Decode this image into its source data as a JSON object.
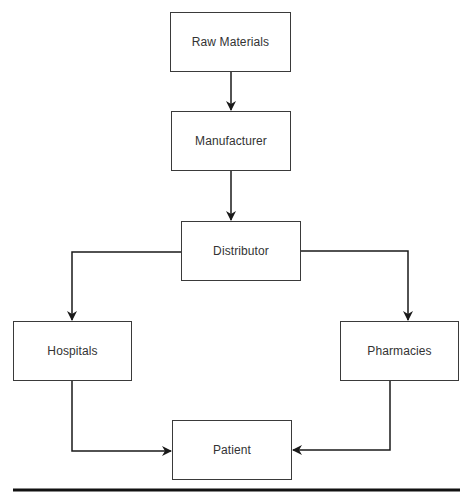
{
  "diagram": {
    "type": "flowchart",
    "title": "",
    "colors": {
      "line": "#1a1a1a",
      "border": "#3a3a3a",
      "text": "#333333",
      "background": "#ffffff"
    },
    "nodes": [
      {
        "id": "raw_materials",
        "label": "Raw Materials",
        "x": 170,
        "y": 12,
        "w": 121,
        "h": 60
      },
      {
        "id": "manufacturer",
        "label": "Manufacturer",
        "x": 171,
        "y": 111,
        "w": 120,
        "h": 60
      },
      {
        "id": "distributor",
        "label": "Distributor",
        "x": 181,
        "y": 221,
        "w": 120,
        "h": 60
      },
      {
        "id": "hospitals",
        "label": "Hospitals",
        "x": 13,
        "y": 321,
        "w": 119,
        "h": 60
      },
      {
        "id": "pharmacies",
        "label": "Pharmacies",
        "x": 340,
        "y": 321,
        "w": 119,
        "h": 60
      },
      {
        "id": "patient",
        "label": "Patient",
        "x": 172,
        "y": 420,
        "w": 120,
        "h": 60
      }
    ],
    "edges": [
      {
        "from": "raw_materials",
        "to": "manufacturer"
      },
      {
        "from": "manufacturer",
        "to": "distributor"
      },
      {
        "from": "distributor",
        "to": "hospitals"
      },
      {
        "from": "distributor",
        "to": "pharmacies"
      },
      {
        "from": "hospitals",
        "to": "patient"
      },
      {
        "from": "pharmacies",
        "to": "patient"
      }
    ]
  }
}
